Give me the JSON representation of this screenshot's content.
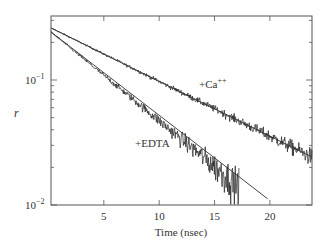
{
  "chart_data": {
    "type": "line",
    "title": "",
    "xlabel": "Time (nsec)",
    "ylabel": "r",
    "xlim": [
      0.23,
      23.8
    ],
    "ylim": [
      0.01,
      0.325
    ],
    "yscale": "log",
    "grid": false,
    "legend": null,
    "x_ticks": [
      5,
      10,
      15,
      20
    ],
    "x_tick_labels": [
      "5",
      "10",
      "15",
      "20"
    ],
    "y_ticks": [
      0.1,
      0.01
    ],
    "y_tick_labels": [
      "10",
      "10"
    ],
    "y_tick_exponents": [
      "−1",
      "−2"
    ],
    "series": [
      {
        "name": "+Ca++",
        "kind": "noisy-decay-data",
        "t_start": 0.23,
        "t_end": 23.8,
        "r_start": 0.261,
        "r_end": 0.0242,
        "noise_scale": 0.6
      },
      {
        "name": "+EDTA",
        "kind": "noisy-decay-data",
        "t_start": 0.23,
        "t_end": 17.2,
        "r_start": 0.242,
        "r_end": 0.0142,
        "noise_scale": 0.75
      }
    ],
    "fits": [
      {
        "name": "Ca++ fit",
        "t": [
          0.23,
          23.8
        ],
        "r": [
          0.261,
          0.0242
        ]
      },
      {
        "name": "EDTA fit",
        "t": [
          0.23,
          19.8
        ],
        "r": [
          0.242,
          0.0112
        ]
      }
    ],
    "annotations": [
      {
        "text": "+Ca",
        "sup": "++",
        "t": 13.4,
        "r": 0.086
      },
      {
        "text": "+EDTA",
        "t": 9.4,
        "r": 0.0385
      }
    ]
  },
  "labels": {
    "xlabel": "Time (nsec)",
    "ylabel": "r",
    "ca_label": "+Ca",
    "ca_sup": "++",
    "edta_label": "+EDTA"
  },
  "colors": {
    "axis": "#555555",
    "data": "#222222",
    "fit": "#333333"
  }
}
